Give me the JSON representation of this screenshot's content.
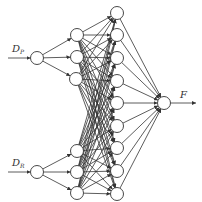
{
  "diagram": {
    "type": "neural-network",
    "inputs": [
      {
        "label": "D",
        "subscript": "P",
        "x": 37,
        "y": 58
      },
      {
        "label": "D",
        "subscript": "R",
        "x": 37,
        "y": 172
      }
    ],
    "hidden1": [
      {
        "x": 77,
        "y": 35,
        "parent": 0
      },
      {
        "x": 77,
        "y": 57,
        "parent": 0
      },
      {
        "x": 76,
        "y": 79,
        "parent": 0
      },
      {
        "x": 77,
        "y": 151,
        "parent": 1
      },
      {
        "x": 77,
        "y": 172,
        "parent": 1
      },
      {
        "x": 77,
        "y": 193,
        "parent": 1
      }
    ],
    "hidden2": [
      {
        "x": 117,
        "y": 13
      },
      {
        "x": 117,
        "y": 35
      },
      {
        "x": 117,
        "y": 58
      },
      {
        "x": 117,
        "y": 81
      },
      {
        "x": 117,
        "y": 103
      },
      {
        "x": 117,
        "y": 126
      },
      {
        "x": 117,
        "y": 148
      },
      {
        "x": 117,
        "y": 171
      },
      {
        "x": 117,
        "y": 194
      }
    ],
    "output": {
      "label": "F",
      "x": 164,
      "y": 103
    },
    "node_radius": 6.5,
    "input_arrow_start_x": 8,
    "output_arrow_end_x": 196,
    "stroke_color": "#333333"
  }
}
